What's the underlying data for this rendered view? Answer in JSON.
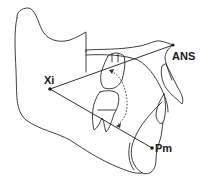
{
  "diagram": {
    "type": "cephalometric tracing",
    "landmarks": [
      {
        "id": "xi",
        "label": "Xi",
        "x": 50,
        "y": 89
      },
      {
        "id": "ans",
        "label": "ANS",
        "x": 173,
        "y": 45
      },
      {
        "id": "pm",
        "label": "Pm",
        "x": 152,
        "y": 148
      }
    ],
    "lines": [
      {
        "from": "Xi",
        "to": "ANS"
      },
      {
        "from": "Xi",
        "to": "Pm"
      }
    ],
    "annotations": [
      "dotted curved arrow indicating angle between Xi-ANS and Xi-Pm"
    ],
    "colors": {
      "stroke": "#2a2a2a",
      "background": "#ffffff"
    }
  }
}
